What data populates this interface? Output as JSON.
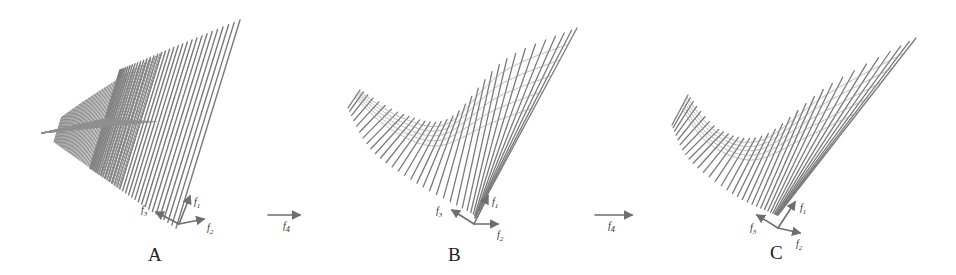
{
  "figure": {
    "line_color": "#7a7a7a",
    "axis_color": "#6e6e6e",
    "panels": [
      {
        "id": "A",
        "label": "A",
        "label_pos": [
          148,
          244
        ],
        "apex": [
          42,
          133
        ],
        "tips_start": [
          120,
          70
        ],
        "tips_end": [
          240,
          20
        ],
        "bases_start": [
          90,
          168
        ],
        "bases_end": [
          176,
          228
        ],
        "mode": "fan",
        "n_lines": 34,
        "axes": {
          "origin": [
            179,
            224
          ],
          "f1": [
            190,
            196
          ],
          "f2": [
            204,
            219
          ],
          "f3": [
            156,
            212
          ]
        },
        "axis_labels": {
          "f1": "f",
          "f1_sub": "1",
          "f2": "f",
          "f2_sub": "2",
          "f3": "f",
          "f3_sub": "3"
        },
        "axis_label_pos": {
          "f1": [
            194,
            196
          ],
          "f2": [
            207,
            222
          ],
          "f3": [
            141,
            204
          ]
        }
      },
      {
        "id": "B",
        "label": "B",
        "label_pos": [
          448,
          244
        ],
        "mode": "saddle",
        "n_lines": 34,
        "curve_top": [
          [
            360,
            90
          ],
          [
            405,
            115
          ],
          [
            450,
            118
          ],
          [
            505,
            60
          ],
          [
            577,
            28
          ]
        ],
        "curve_bottom": [
          [
            348,
            108
          ],
          [
            372,
            150
          ],
          [
            420,
            185
          ],
          [
            470,
            212
          ],
          [
            475,
            218
          ]
        ],
        "axes": {
          "origin": [
            474,
            224
          ],
          "f1": [
            488,
            196
          ],
          "f2": [
            498,
            224
          ],
          "f3": [
            452,
            210
          ]
        },
        "axis_labels": {
          "f1": "f",
          "f1_sub": "1",
          "f2": "f",
          "f2_sub": "2",
          "f3": "f",
          "f3_sub": "3"
        },
        "axis_label_pos": {
          "f1": [
            492,
            196
          ],
          "f2": [
            497,
            229
          ],
          "f3": [
            436,
            205
          ]
        }
      },
      {
        "id": "C",
        "label": "C",
        "label_pos": [
          770,
          242
        ],
        "mode": "saddle",
        "n_lines": 34,
        "curve_top": [
          [
            688,
            95
          ],
          [
            720,
            130
          ],
          [
            765,
            135
          ],
          [
            830,
            85
          ],
          [
            916,
            38
          ]
        ],
        "curve_bottom": [
          [
            672,
            125
          ],
          [
            690,
            160
          ],
          [
            735,
            195
          ],
          [
            770,
            212
          ],
          [
            778,
            215
          ]
        ],
        "axes": {
          "origin": [
            778,
            228
          ],
          "f1": [
            795,
            202
          ],
          "f2": [
            800,
            233
          ],
          "f3": [
            757,
            215
          ]
        },
        "axis_labels": {
          "f1": "f",
          "f1_sub": "1",
          "f2": "f",
          "f2_sub": "2",
          "f3": "f",
          "f3_sub": "3"
        },
        "axis_label_pos": {
          "f1": [
            800,
            202
          ],
          "f2": [
            796,
            238
          ],
          "f3": [
            750,
            222
          ]
        }
      }
    ],
    "operators": [
      {
        "label": "f",
        "sub": "4",
        "from": [
          268,
          215
        ],
        "to": [
          300,
          215
        ],
        "label_pos": [
          283,
          220
        ]
      },
      {
        "label": "f",
        "sub": "4",
        "from": [
          595,
          215
        ],
        "to": [
          632,
          215
        ],
        "label_pos": [
          608,
          220
        ]
      }
    ]
  }
}
